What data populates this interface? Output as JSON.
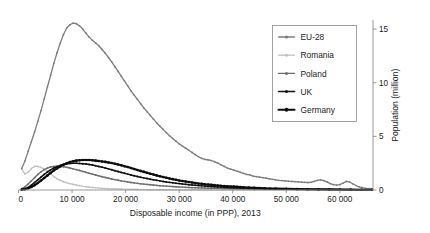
{
  "chart_data": {
    "type": "line",
    "title": "",
    "xlabel": "Disposable income (in PPP), 2013",
    "ylabel": "Population (million)",
    "xlim": [
      0,
      66000
    ],
    "ylim": [
      0,
      15.8
    ],
    "xticks": [
      0,
      10000,
      20000,
      30000,
      40000,
      50000,
      60000
    ],
    "xticklabels": [
      "0",
      "10 000",
      "20 000",
      "30 000",
      "40 000",
      "50 000",
      "60 000"
    ],
    "yticks": [
      0,
      5,
      10,
      15
    ],
    "yticklabels": [
      "0",
      "5",
      "10",
      "15"
    ],
    "y_axis_position": "right",
    "grid": false,
    "legend_position": "upper-right-inside",
    "markers": "filled-circle-every-point",
    "series": [
      {
        "name": "EU-28",
        "color": "#7d7d7d",
        "linewidth": 1.3,
        "x": [
          600,
          1200,
          1800,
          2400,
          3000,
          3600,
          4200,
          4800,
          5400,
          6000,
          6600,
          7200,
          7800,
          8400,
          9000,
          9600,
          10200,
          10800,
          11400,
          12000,
          12600,
          13200,
          13800,
          14400,
          15000,
          15600,
          16200,
          16800,
          17400,
          18000,
          18600,
          19200,
          19800,
          20400,
          21000,
          21600,
          22200,
          22800,
          23400,
          24000,
          24600,
          25200,
          25800,
          26400,
          27000,
          27600,
          28200,
          28800,
          29400,
          30000,
          30600,
          31200,
          31800,
          32400,
          33000,
          33600,
          34200,
          34800,
          35400,
          36000,
          36600,
          37200,
          37800,
          38400,
          39000,
          39600,
          40200,
          40800,
          41400,
          42000,
          42600,
          43200,
          43800,
          44400,
          45000,
          45600,
          46200,
          46800,
          47400,
          48000,
          48600,
          49200,
          49800,
          50400,
          51000,
          51600,
          52200,
          52800,
          53400,
          54000,
          54600,
          55200,
          55800,
          56400,
          57000,
          57600,
          58200,
          58800,
          59400,
          60000,
          60600,
          61200,
          61800,
          62400,
          63000,
          63600,
          64200,
          64800,
          65400,
          66000
        ],
        "y": [
          2.0,
          2.7,
          3.6,
          4.5,
          5.4,
          6.4,
          7.4,
          8.5,
          9.6,
          10.7,
          11.8,
          12.8,
          13.7,
          14.5,
          15.1,
          15.4,
          15.55,
          15.5,
          15.3,
          15.0,
          14.6,
          14.25,
          13.95,
          13.7,
          13.45,
          13.1,
          12.75,
          12.35,
          11.95,
          11.5,
          11.05,
          10.6,
          10.15,
          9.7,
          9.25,
          8.85,
          8.45,
          8.05,
          7.65,
          7.3,
          6.95,
          6.6,
          6.25,
          5.95,
          5.65,
          5.35,
          5.05,
          4.8,
          4.55,
          4.3,
          4.1,
          3.9,
          3.7,
          3.5,
          3.3,
          3.1,
          2.95,
          2.85,
          2.8,
          2.75,
          2.65,
          2.5,
          2.35,
          2.2,
          2.05,
          1.95,
          1.85,
          1.75,
          1.65,
          1.55,
          1.45,
          1.4,
          1.3,
          1.25,
          1.2,
          1.15,
          1.1,
          1.05,
          1.0,
          0.95,
          0.9,
          0.88,
          0.85,
          0.82,
          0.8,
          0.78,
          0.76,
          0.74,
          0.72,
          0.7,
          0.72,
          0.8,
          0.9,
          0.95,
          0.88,
          0.75,
          0.6,
          0.5,
          0.45,
          0.5,
          0.65,
          0.8,
          0.75,
          0.58,
          0.42,
          0.3,
          0.22,
          0.16,
          0.12,
          0.1
        ]
      },
      {
        "name": "Romania",
        "color": "#bfbfbf",
        "linewidth": 1.2,
        "x": [
          600,
          1200,
          1800,
          2400,
          3000,
          3600,
          4200,
          4800,
          5400,
          6000,
          6600,
          7200,
          7800,
          8400,
          9000,
          9600,
          10200,
          10800,
          11400,
          12000,
          12600,
          13200,
          13800,
          14400,
          15000,
          15600,
          16200,
          16800,
          17400,
          18000,
          18600,
          19200,
          19800,
          20400,
          21000,
          21600,
          22200,
          22800,
          23400,
          24000,
          24600,
          25200,
          25800,
          26400,
          27000,
          27600,
          28200,
          28800,
          29400,
          30000,
          31200,
          32400,
          33600,
          34800,
          36000,
          38000,
          40000,
          44000,
          48000,
          52000,
          56000,
          60000,
          66000
        ],
        "y": [
          1.95,
          1.5,
          1.65,
          2.0,
          2.2,
          2.2,
          2.1,
          1.95,
          1.75,
          1.5,
          1.25,
          1.05,
          0.9,
          0.78,
          0.68,
          0.6,
          0.52,
          0.46,
          0.4,
          0.35,
          0.31,
          0.27,
          0.24,
          0.21,
          0.18,
          0.16,
          0.14,
          0.12,
          0.11,
          0.1,
          0.09,
          0.08,
          0.07,
          0.065,
          0.06,
          0.055,
          0.05,
          0.048,
          0.045,
          0.042,
          0.04,
          0.038,
          0.035,
          0.033,
          0.03,
          0.028,
          0.026,
          0.024,
          0.022,
          0.02,
          0.018,
          0.016,
          0.014,
          0.012,
          0.01,
          0.009,
          0.008,
          0.006,
          0.005,
          0.004,
          0.003,
          0.002,
          0.001
        ]
      },
      {
        "name": "Poland",
        "color": "#6e6e6e",
        "linewidth": 1.4,
        "x": [
          600,
          1200,
          1800,
          2400,
          3000,
          3600,
          4200,
          4800,
          5400,
          6000,
          6600,
          7200,
          7800,
          8400,
          9000,
          9600,
          10200,
          10800,
          11400,
          12000,
          12600,
          13200,
          13800,
          14400,
          15000,
          15600,
          16200,
          16800,
          17400,
          18000,
          18600,
          19200,
          19800,
          20400,
          21000,
          21600,
          22200,
          22800,
          23400,
          24000,
          24600,
          25200,
          25800,
          26400,
          27000,
          27600,
          28200,
          28800,
          29400,
          30000,
          30600,
          31200,
          31800,
          32400,
          33000,
          33600,
          34200,
          34800,
          35400,
          36000,
          37200,
          38400,
          39600,
          40800,
          42000,
          43200,
          44400,
          45600,
          46800,
          48000,
          50000,
          52000,
          54000,
          56000,
          58000,
          60000,
          62000,
          64000,
          66000
        ],
        "y": [
          0.12,
          0.3,
          0.55,
          0.85,
          1.15,
          1.45,
          1.7,
          1.9,
          2.05,
          2.15,
          2.2,
          2.22,
          2.2,
          2.17,
          2.12,
          2.05,
          1.97,
          1.9,
          1.82,
          1.73,
          1.65,
          1.56,
          1.48,
          1.4,
          1.32,
          1.24,
          1.17,
          1.1,
          1.03,
          0.97,
          0.91,
          0.85,
          0.8,
          0.75,
          0.7,
          0.66,
          0.62,
          0.58,
          0.55,
          0.52,
          0.49,
          0.46,
          0.43,
          0.4,
          0.38,
          0.36,
          0.34,
          0.32,
          0.3,
          0.28,
          0.27,
          0.25,
          0.24,
          0.22,
          0.21,
          0.2,
          0.19,
          0.18,
          0.17,
          0.16,
          0.15,
          0.13,
          0.12,
          0.11,
          0.1,
          0.09,
          0.085,
          0.08,
          0.075,
          0.07,
          0.06,
          0.05,
          0.045,
          0.04,
          0.035,
          0.03,
          0.025,
          0.02,
          0.015
        ]
      },
      {
        "name": "UK",
        "color": "#111111",
        "linewidth": 1.5,
        "x": [
          600,
          1200,
          1800,
          2400,
          3000,
          3600,
          4200,
          4800,
          5400,
          6000,
          6600,
          7200,
          7800,
          8400,
          9000,
          9600,
          10200,
          10800,
          11400,
          12000,
          12600,
          13200,
          13800,
          14400,
          15000,
          15600,
          16200,
          16800,
          17400,
          18000,
          18600,
          19200,
          19800,
          20400,
          21000,
          21600,
          22200,
          22800,
          23400,
          24000,
          24600,
          25200,
          25800,
          26400,
          27000,
          27600,
          28200,
          28800,
          29400,
          30000,
          30600,
          31200,
          31800,
          32400,
          33000,
          33600,
          34200,
          34800,
          35400,
          36000,
          36600,
          37200,
          37800,
          38400,
          39000,
          39600,
          40200,
          40800,
          41400,
          42000,
          43000,
          44000,
          45000,
          46000,
          47000,
          48000,
          50000,
          52000,
          54000,
          56000,
          58000,
          60000,
          62000,
          64000,
          66000
        ],
        "y": [
          0.05,
          0.12,
          0.25,
          0.45,
          0.7,
          0.95,
          1.2,
          1.45,
          1.68,
          1.88,
          2.05,
          2.18,
          2.3,
          2.38,
          2.44,
          2.48,
          2.5,
          2.5,
          2.48,
          2.45,
          2.42,
          2.38,
          2.33,
          2.27,
          2.2,
          2.13,
          2.05,
          1.97,
          1.89,
          1.8,
          1.72,
          1.64,
          1.56,
          1.48,
          1.4,
          1.33,
          1.26,
          1.19,
          1.13,
          1.07,
          1.01,
          0.95,
          0.9,
          0.85,
          0.8,
          0.75,
          0.71,
          0.67,
          0.63,
          0.6,
          0.56,
          0.53,
          0.5,
          0.47,
          0.44,
          0.42,
          0.39,
          0.37,
          0.35,
          0.33,
          0.31,
          0.29,
          0.27,
          0.26,
          0.24,
          0.23,
          0.21,
          0.2,
          0.19,
          0.18,
          0.16,
          0.145,
          0.13,
          0.12,
          0.11,
          0.1,
          0.085,
          0.07,
          0.06,
          0.05,
          0.04,
          0.035,
          0.03,
          0.025,
          0.02
        ]
      },
      {
        "name": "Germany",
        "color": "#0d0d0d",
        "linewidth": 2.1,
        "x": [
          600,
          1200,
          1800,
          2400,
          3000,
          3600,
          4200,
          4800,
          5400,
          6000,
          6600,
          7200,
          7800,
          8400,
          9000,
          9600,
          10200,
          10800,
          11400,
          12000,
          12600,
          13200,
          13800,
          14400,
          15000,
          15600,
          16200,
          16800,
          17400,
          18000,
          18600,
          19200,
          19800,
          20400,
          21000,
          21600,
          22200,
          22800,
          23400,
          24000,
          24600,
          25200,
          25800,
          26400,
          27000,
          27600,
          28200,
          28800,
          29400,
          30000,
          30600,
          31200,
          31800,
          32400,
          33000,
          33600,
          34200,
          34800,
          35400,
          36000,
          36600,
          37200,
          37800,
          38400,
          39000,
          39600,
          40200,
          40800,
          41400,
          42000,
          43000,
          44000,
          45000,
          46000,
          47000,
          48000,
          50000,
          52000,
          54000,
          56000,
          58000,
          60000,
          62000,
          64000,
          66000
        ],
        "y": [
          0.03,
          0.08,
          0.16,
          0.28,
          0.45,
          0.65,
          0.88,
          1.12,
          1.36,
          1.6,
          1.82,
          2.02,
          2.2,
          2.36,
          2.5,
          2.6,
          2.68,
          2.74,
          2.78,
          2.8,
          2.8,
          2.79,
          2.77,
          2.74,
          2.7,
          2.66,
          2.62,
          2.57,
          2.51,
          2.45,
          2.38,
          2.3,
          2.22,
          2.14,
          2.05,
          1.96,
          1.87,
          1.78,
          1.69,
          1.6,
          1.52,
          1.44,
          1.36,
          1.28,
          1.21,
          1.14,
          1.07,
          1.01,
          0.95,
          0.89,
          0.84,
          0.79,
          0.74,
          0.7,
          0.65,
          0.61,
          0.58,
          0.54,
          0.51,
          0.48,
          0.45,
          0.42,
          0.39,
          0.37,
          0.35,
          0.33,
          0.31,
          0.29,
          0.27,
          0.25,
          0.22,
          0.2,
          0.18,
          0.16,
          0.145,
          0.13,
          0.11,
          0.09,
          0.075,
          0.065,
          0.055,
          0.045,
          0.038,
          0.03,
          0.025
        ]
      }
    ]
  },
  "legend": {
    "entries": [
      {
        "label": "EU-28"
      },
      {
        "label": "Romania"
      },
      {
        "label": "Poland"
      },
      {
        "label": "UK"
      },
      {
        "label": "Germany"
      }
    ]
  }
}
